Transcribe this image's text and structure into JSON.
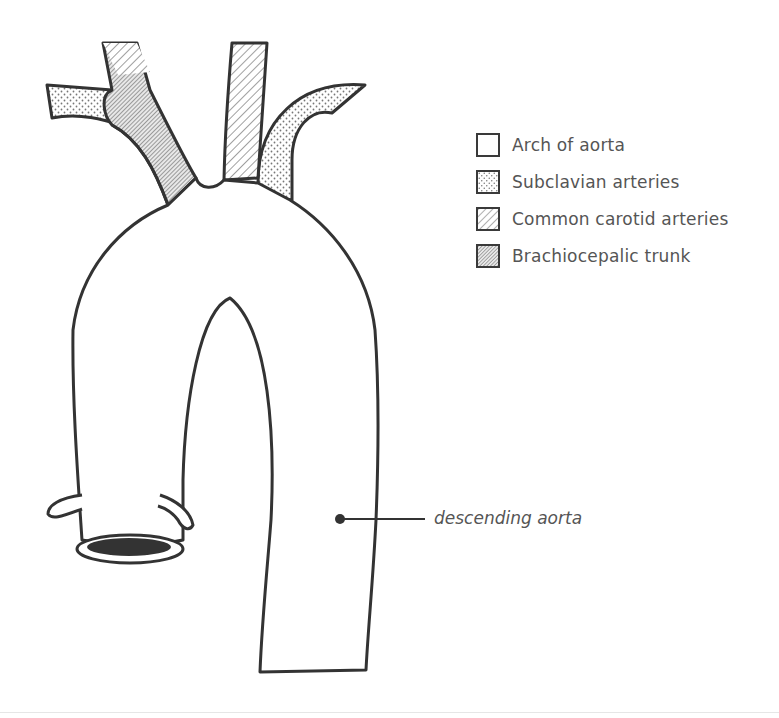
{
  "diagram": {
    "subject": "Aorta",
    "colors": {
      "outline": "#333333",
      "text": "#555555",
      "background": "#ffffff",
      "lumen_fill": "#333333"
    },
    "legend": {
      "items": [
        {
          "label": "Arch of aorta",
          "pattern": "plain",
          "icon": "blank-square-icon"
        },
        {
          "label": "Subclavian arteries",
          "pattern": "dots",
          "icon": "dotted-square-icon"
        },
        {
          "label": "Common carotid arteries",
          "pattern": "light-hatch",
          "icon": "hatched-square-icon"
        },
        {
          "label": "Brachiocepalic trunk",
          "pattern": "dense-hatch",
          "icon": "dense-hatched-square-icon"
        }
      ]
    },
    "callouts": [
      {
        "label": "descending aorta",
        "target": "descending-aorta"
      }
    ]
  }
}
